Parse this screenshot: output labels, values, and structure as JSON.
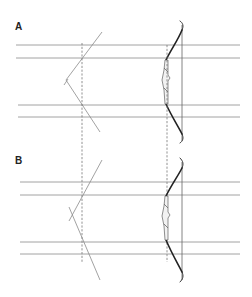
{
  "figure": {
    "panels": [
      {
        "label": "A",
        "configuration": "angled lines meet at a single apex left of the left dashed guide (V-shape)"
      },
      {
        "label": "B",
        "configuration": "angled lines cross each other left of the left dashed guide (X-shape)"
      }
    ],
    "elements": {
      "horizontal_reference_lines_per_panel": 4,
      "dashed_vertical_guides": 2,
      "bow_per_panel": 1
    },
    "colors": {
      "lines": "#8a8a8a",
      "bow": "#222222",
      "background": "#ffffff"
    }
  }
}
